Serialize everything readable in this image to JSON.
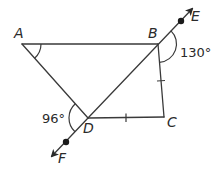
{
  "diagram": {
    "type": "geometry",
    "points": {
      "A": {
        "label": "A",
        "x": 22,
        "y": 44
      },
      "B": {
        "label": "B",
        "x": 158,
        "y": 44
      },
      "C": {
        "label": "C",
        "x": 164,
        "y": 117
      },
      "D": {
        "label": "D",
        "x": 88,
        "y": 118
      },
      "E": {
        "label": "E"
      },
      "F": {
        "label": "F"
      }
    },
    "segments": [
      "AB",
      "AD",
      "BC",
      "DC",
      "BD"
    ],
    "line": {
      "name": "EF",
      "through": [
        "B",
        "D"
      ],
      "arrows": [
        "E",
        "F"
      ]
    },
    "congruent_marks": [
      "BC",
      "DC"
    ],
    "angles": {
      "angle_A": {
        "vertex": "A",
        "marked": true,
        "value": ""
      },
      "angle_EBC": {
        "vertex": "B",
        "value": "130°"
      },
      "angle_ADF": {
        "vertex": "D",
        "value": "96°"
      }
    }
  }
}
